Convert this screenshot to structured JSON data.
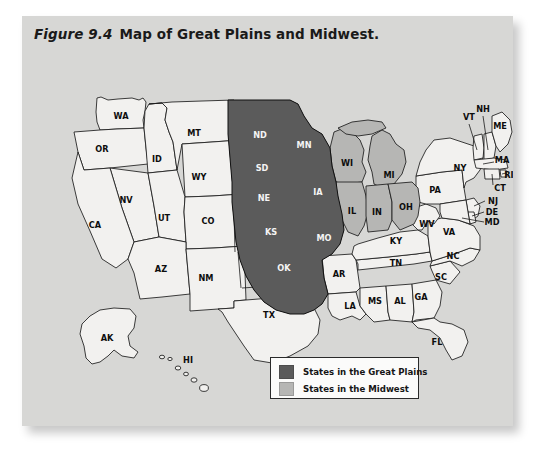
{
  "figure": {
    "number": "Figure 9.4",
    "title": "Map of Great Plains and Midwest.",
    "background_color": "#d7d7d5",
    "page_color": "#ffffff"
  },
  "colors": {
    "great_plains_fill": "#5b5b5b",
    "midwest_fill": "#b6b6b4",
    "other_states_fill": "#f2f1ef",
    "outline": "#1b1b1b"
  },
  "legend": {
    "items": [
      {
        "label": "States in the Great Plains",
        "swatch": "#5b5b5b",
        "key": "great_plains"
      },
      {
        "label": "States in the Midwest",
        "swatch": "#b6b6b4",
        "key": "midwest"
      }
    ]
  },
  "map": {
    "region": "United States",
    "insets": [
      "AK",
      "HI"
    ],
    "great_plains_states": [
      "ND",
      "SD",
      "NE",
      "KS",
      "OK",
      "MN",
      "IA",
      "MO",
      "MT",
      "WY",
      "CO",
      "NM",
      "TX"
    ],
    "midwest_states": [
      "WI",
      "MI",
      "IL",
      "IN",
      "OH"
    ],
    "state_labels": [
      {
        "abbr": "WA",
        "x": 99,
        "y": 100,
        "shade": "light"
      },
      {
        "abbr": "OR",
        "x": 80,
        "y": 133,
        "shade": "light"
      },
      {
        "abbr": "ID",
        "x": 135,
        "y": 143,
        "shade": "light"
      },
      {
        "abbr": "MT",
        "x": 172,
        "y": 117,
        "shade": "light"
      },
      {
        "abbr": "WY",
        "x": 177,
        "y": 161,
        "shade": "light"
      },
      {
        "abbr": "NV",
        "x": 104,
        "y": 184,
        "shade": "light"
      },
      {
        "abbr": "CA",
        "x": 73,
        "y": 209,
        "shade": "light"
      },
      {
        "abbr": "UT",
        "x": 142,
        "y": 202,
        "shade": "light"
      },
      {
        "abbr": "CO",
        "x": 186,
        "y": 205,
        "shade": "light"
      },
      {
        "abbr": "AZ",
        "x": 139,
        "y": 253,
        "shade": "light"
      },
      {
        "abbr": "NM",
        "x": 184,
        "y": 262,
        "shade": "light"
      },
      {
        "abbr": "ND",
        "x": 238,
        "y": 119,
        "shade": "dark"
      },
      {
        "abbr": "SD",
        "x": 240,
        "y": 152,
        "shade": "dark"
      },
      {
        "abbr": "NE",
        "x": 242,
        "y": 182,
        "shade": "dark"
      },
      {
        "abbr": "KS",
        "x": 249,
        "y": 216,
        "shade": "dark"
      },
      {
        "abbr": "OK",
        "x": 262,
        "y": 252,
        "shade": "dark"
      },
      {
        "abbr": "TX",
        "x": 247,
        "y": 299,
        "shade": "light"
      },
      {
        "abbr": "MN",
        "x": 282,
        "y": 129,
        "shade": "dark"
      },
      {
        "abbr": "IA",
        "x": 296,
        "y": 176,
        "shade": "dark"
      },
      {
        "abbr": "MO",
        "x": 302,
        "y": 222,
        "shade": "dark"
      },
      {
        "abbr": "AR",
        "x": 317,
        "y": 258,
        "shade": "light"
      },
      {
        "abbr": "LA",
        "x": 328,
        "y": 290,
        "shade": "light"
      },
      {
        "abbr": "WI",
        "x": 325,
        "y": 147,
        "shade": "mid"
      },
      {
        "abbr": "IL",
        "x": 330,
        "y": 195,
        "shade": "mid"
      },
      {
        "abbr": "MI",
        "x": 367,
        "y": 159,
        "shade": "mid"
      },
      {
        "abbr": "IN",
        "x": 355,
        "y": 196,
        "shade": "mid"
      },
      {
        "abbr": "OH",
        "x": 384,
        "y": 191,
        "shade": "mid"
      },
      {
        "abbr": "KY",
        "x": 374,
        "y": 225,
        "shade": "light"
      },
      {
        "abbr": "TN",
        "x": 374,
        "y": 247,
        "shade": "light"
      },
      {
        "abbr": "MS",
        "x": 353,
        "y": 285,
        "shade": "light"
      },
      {
        "abbr": "AL",
        "x": 378,
        "y": 285,
        "shade": "light"
      },
      {
        "abbr": "GA",
        "x": 399,
        "y": 281,
        "shade": "light"
      },
      {
        "abbr": "FL",
        "x": 415,
        "y": 326,
        "shade": "light"
      },
      {
        "abbr": "SC",
        "x": 419,
        "y": 261,
        "shade": "light"
      },
      {
        "abbr": "NC",
        "x": 431,
        "y": 240,
        "shade": "light"
      },
      {
        "abbr": "VA",
        "x": 427,
        "y": 216,
        "shade": "light"
      },
      {
        "abbr": "WV",
        "x": 405,
        "y": 208,
        "shade": "light"
      },
      {
        "abbr": "PA",
        "x": 413,
        "y": 174,
        "shade": "light"
      },
      {
        "abbr": "NY",
        "x": 438,
        "y": 152,
        "shade": "light"
      },
      {
        "abbr": "VT",
        "x": 447,
        "y": 101,
        "shade": "light"
      },
      {
        "abbr": "NH",
        "x": 461,
        "y": 93,
        "shade": "light"
      },
      {
        "abbr": "ME",
        "x": 478,
        "y": 110,
        "shade": "light"
      },
      {
        "abbr": "MA",
        "x": 480,
        "y": 144,
        "shade": "light"
      },
      {
        "abbr": "RI",
        "x": 487,
        "y": 159,
        "shade": "light"
      },
      {
        "abbr": "CT",
        "x": 478,
        "y": 172,
        "shade": "light"
      },
      {
        "abbr": "NJ",
        "x": 471,
        "y": 185,
        "shade": "light"
      },
      {
        "abbr": "DE",
        "x": 470,
        "y": 196,
        "shade": "light"
      },
      {
        "abbr": "MD",
        "x": 470,
        "y": 206,
        "shade": "light"
      },
      {
        "abbr": "AK",
        "x": 85,
        "y": 322,
        "shade": "light"
      },
      {
        "abbr": "HI",
        "x": 166,
        "y": 344,
        "shade": "light"
      }
    ]
  }
}
